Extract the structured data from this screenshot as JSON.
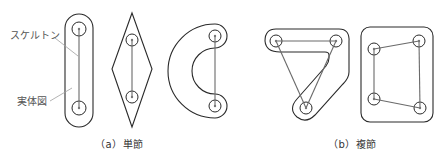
{
  "figure": {
    "labels": {
      "skeleton": "スケルトン",
      "solid": "実体図"
    },
    "captions": {
      "a": "（a）単節",
      "b": "（b）複節"
    }
  },
  "diagram": {
    "groups": [
      {
        "id": "a",
        "name": "単節",
        "shapes": [
          {
            "type": "capsule-link",
            "joints": [
              [
                79,
                29
              ],
              [
                79,
                108
              ]
            ]
          },
          {
            "type": "diamond-link",
            "joints": [
              [
                132,
                40
              ],
              [
                132,
                97
              ]
            ]
          },
          {
            "type": "crescent-link",
            "joints": [
              [
                215,
                36
              ],
              [
                215,
                106
              ]
            ]
          }
        ]
      },
      {
        "id": "b",
        "name": "複節",
        "shapes": [
          {
            "type": "ternary-link",
            "joints": [
              [
                276,
                41
              ],
              [
                336,
                41
              ],
              [
                306,
                108
              ]
            ]
          },
          {
            "type": "quaternary-link",
            "joints": [
              [
                374,
                49
              ],
              [
                419,
                41
              ],
              [
                374,
                99
              ],
              [
                420,
                108
              ]
            ]
          }
        ]
      }
    ]
  }
}
